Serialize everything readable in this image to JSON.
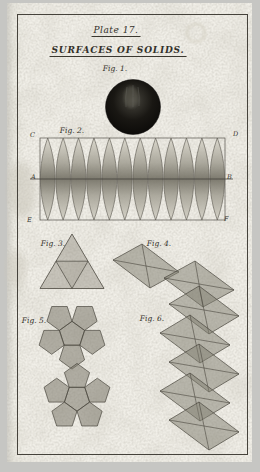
{
  "header": {
    "plate_title": "Plate 17.",
    "subtitle": "SURFACES OF SOLIDS."
  },
  "figures": {
    "fig1": {
      "label": "Fig. 1.",
      "subject": "sphere"
    },
    "fig2": {
      "label": "Fig. 2.",
      "subject": "spherical-gores",
      "point_labels": {
        "c": "C",
        "d": "D",
        "a": "A",
        "b": "B",
        "e": "E",
        "f": "F"
      }
    },
    "fig3": {
      "label": "Fig. 3.",
      "subject": "tetrahedron-net"
    },
    "fig4": {
      "label": "Fig. 4.",
      "subject": "octahedron-net"
    },
    "fig5": {
      "label": "Fig. 5.",
      "subject": "dodecahedron-net"
    },
    "fig6": {
      "label": "Fig. 6.",
      "subject": "icosahedron-net"
    }
  },
  "colors": {
    "photo_background": "#c6c6c3",
    "paper": "#f0eee7",
    "frame_line": "#45423b",
    "ink": "#33302a",
    "engraving_gray": "#8c897d",
    "sphere_black": "#14120e"
  }
}
